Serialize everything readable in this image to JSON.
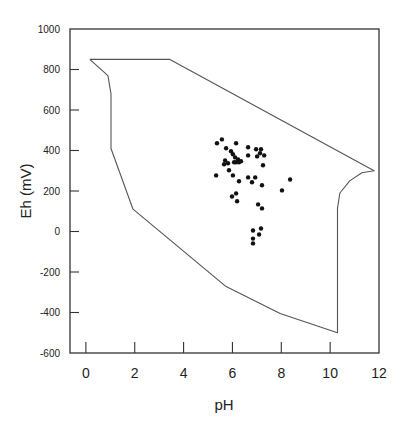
{
  "chart_data": {
    "type": "scatter",
    "title": "",
    "xlabel": "pH",
    "ylabel": "Eh (mV)",
    "xlim": [
      -0.65,
      12
    ],
    "ylim": [
      -600,
      1000
    ],
    "grid": false,
    "legend": null,
    "x_ticks": [
      0,
      2,
      4,
      6,
      8,
      10,
      12
    ],
    "y_ticks": [
      1000,
      800,
      600,
      400,
      200,
      0,
      -200,
      -400,
      -600
    ],
    "boundary_polygon": {
      "description": "Outline enclosing the natural-water Eh-pH field",
      "points": [
        [
          0.16,
          850
        ],
        [
          3.44,
          850
        ],
        [
          11.8,
          300
        ],
        [
          11.3,
          290
        ],
        [
          10.8,
          250
        ],
        [
          10.4,
          190
        ],
        [
          10.3,
          115
        ],
        [
          10.3,
          -500
        ],
        [
          7.95,
          -405
        ],
        [
          5.74,
          -272
        ],
        [
          1.93,
          110
        ],
        [
          1.03,
          410
        ],
        [
          1.03,
          680
        ],
        [
          0.9,
          770
        ],
        [
          0.16,
          850
        ]
      ]
    },
    "points": [
      {
        "x": 5.37,
        "y": 436
      },
      {
        "x": 5.57,
        "y": 455
      },
      {
        "x": 6.15,
        "y": 436
      },
      {
        "x": 5.74,
        "y": 411
      },
      {
        "x": 5.94,
        "y": 396
      },
      {
        "x": 6.02,
        "y": 381
      },
      {
        "x": 6.23,
        "y": 356
      },
      {
        "x": 6.11,
        "y": 366
      },
      {
        "x": 6.07,
        "y": 342
      },
      {
        "x": 6.27,
        "y": 342
      },
      {
        "x": 6.35,
        "y": 347
      },
      {
        "x": 6.15,
        "y": 342
      },
      {
        "x": 5.7,
        "y": 351
      },
      {
        "x": 5.82,
        "y": 337
      },
      {
        "x": 5.66,
        "y": 332
      },
      {
        "x": 6.64,
        "y": 416
      },
      {
        "x": 6.97,
        "y": 406
      },
      {
        "x": 7.17,
        "y": 406
      },
      {
        "x": 6.64,
        "y": 376
      },
      {
        "x": 7.01,
        "y": 371
      },
      {
        "x": 7.13,
        "y": 386
      },
      {
        "x": 7.3,
        "y": 376
      },
      {
        "x": 7.25,
        "y": 327
      },
      {
        "x": 5.86,
        "y": 302
      },
      {
        "x": 5.33,
        "y": 277
      },
      {
        "x": 6.02,
        "y": 277
      },
      {
        "x": 6.27,
        "y": 248
      },
      {
        "x": 6.64,
        "y": 267
      },
      {
        "x": 6.93,
        "y": 267
      },
      {
        "x": 6.8,
        "y": 243
      },
      {
        "x": 7.21,
        "y": 228
      },
      {
        "x": 8.36,
        "y": 257
      },
      {
        "x": 8.03,
        "y": 203
      },
      {
        "x": 5.98,
        "y": 173
      },
      {
        "x": 6.15,
        "y": 188
      },
      {
        "x": 6.19,
        "y": 149
      },
      {
        "x": 7.05,
        "y": 134
      },
      {
        "x": 7.21,
        "y": 114
      },
      {
        "x": 6.84,
        "y": 5
      },
      {
        "x": 7.09,
        "y": -15
      },
      {
        "x": 7.17,
        "y": 15
      },
      {
        "x": 6.84,
        "y": -35
      },
      {
        "x": 6.84,
        "y": -59
      }
    ],
    "colors": {
      "points": "#111111",
      "boundary": "#555555",
      "frame": "#333333"
    }
  }
}
